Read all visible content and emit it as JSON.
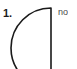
{
  "page": {
    "background_color": "#ffffff",
    "width": 77,
    "height": 69
  },
  "question": {
    "number_label": "1.",
    "side_note_text": "no"
  },
  "figure": {
    "name": "half-disc-shape",
    "stroke_color": "#1a1a1a",
    "fill_color": "#ffffff",
    "stroke_width": 1.6,
    "chord_x": 51,
    "chord_top_y": 8,
    "chord_bottom_y": 88,
    "arc_leftmost_x": 21,
    "arc_center_y": 48
  }
}
